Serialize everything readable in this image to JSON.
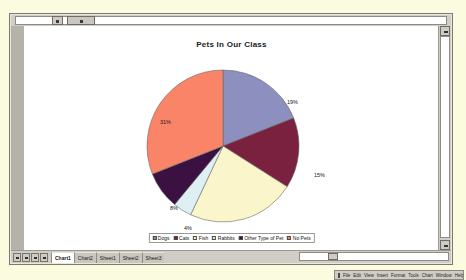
{
  "window": {
    "title": "Pets In Our Class"
  },
  "chart_data": {
    "type": "pie",
    "title": "Pets In Our Class",
    "xlabel": "",
    "ylabel": "",
    "legend_position": "bottom",
    "grid": false,
    "categories": [
      "Dogs",
      "Cats",
      "Fish",
      "Rabbits",
      "Other Type of Pet",
      "No Pets"
    ],
    "values": [
      19,
      15,
      23,
      4,
      8,
      31
    ],
    "labels": [
      "19%",
      "15%",
      "23%",
      "4%",
      "8%",
      "31%"
    ],
    "colors": [
      "#8d8fbe",
      "#79213f",
      "#fbf5cb",
      "#dff0f5",
      "#3a1141",
      "#fa8468"
    ],
    "slices": [
      {
        "name": "Dogs",
        "value": 19,
        "label": "19%",
        "color": "#8d8fbe"
      },
      {
        "name": "Cats",
        "value": 15,
        "label": "15%",
        "color": "#79213f"
      },
      {
        "name": "Fish",
        "value": 23,
        "label": "23%",
        "color": "#fbf5cb"
      },
      {
        "name": "Rabbits",
        "value": 4,
        "label": "4%",
        "color": "#dff0f5"
      },
      {
        "name": "Other Type of Pet",
        "value": 8,
        "label": "8%",
        "color": "#3a1141"
      },
      {
        "name": "No Pets",
        "value": 31,
        "label": "31%",
        "color": "#fa8468"
      }
    ]
  },
  "sheet_tabs": [
    {
      "label": "Chart1",
      "active": true
    },
    {
      "label": "Chart2",
      "active": false
    },
    {
      "label": "Sheet1",
      "active": false
    },
    {
      "label": "Sheet2",
      "active": false
    },
    {
      "label": "Sheet3",
      "active": false
    }
  ],
  "mini_toolbar": {
    "items": [
      "File",
      "Edit",
      "View",
      "Insert",
      "Format",
      "Tools",
      "Chart",
      "Window",
      "Help"
    ]
  }
}
